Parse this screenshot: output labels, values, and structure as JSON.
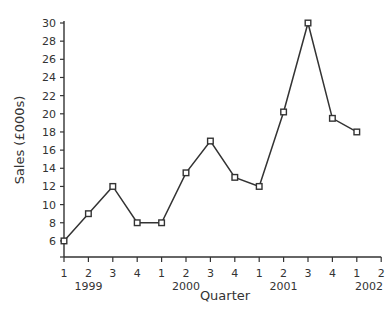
{
  "chart_data": {
    "type": "line",
    "title": "",
    "xlabel": "Quarter",
    "ylabel": "Sales (£000s)",
    "ylim": [
      4,
      30
    ],
    "yticks": [
      6,
      8,
      10,
      12,
      14,
      16,
      18,
      20,
      22,
      24,
      26,
      28,
      30
    ],
    "x": [
      "1999 Q1",
      "1999 Q2",
      "1999 Q3",
      "1999 Q4",
      "2000 Q1",
      "2000 Q2",
      "2000 Q3",
      "2000 Q4",
      "2001 Q1",
      "2001 Q2",
      "2001 Q3",
      "2001 Q4",
      "2002 Q1"
    ],
    "xtick_labels": [
      "1",
      "2",
      "3",
      "4",
      "1",
      "2",
      "3",
      "4",
      "1",
      "2",
      "3",
      "4",
      "1",
      "2"
    ],
    "year_labels": [
      {
        "label": "1999",
        "center_index": 1
      },
      {
        "label": "2000",
        "center_index": 5
      },
      {
        "label": "2001",
        "center_index": 9
      },
      {
        "label": "2002",
        "center_index": 12.5
      }
    ],
    "series": [
      {
        "name": "Sales",
        "values": [
          6,
          9,
          12,
          8,
          8,
          13.5,
          17,
          13,
          12,
          20.2,
          30,
          19.5,
          18
        ]
      }
    ],
    "marker": "square",
    "grid": false,
    "legend": null
  }
}
